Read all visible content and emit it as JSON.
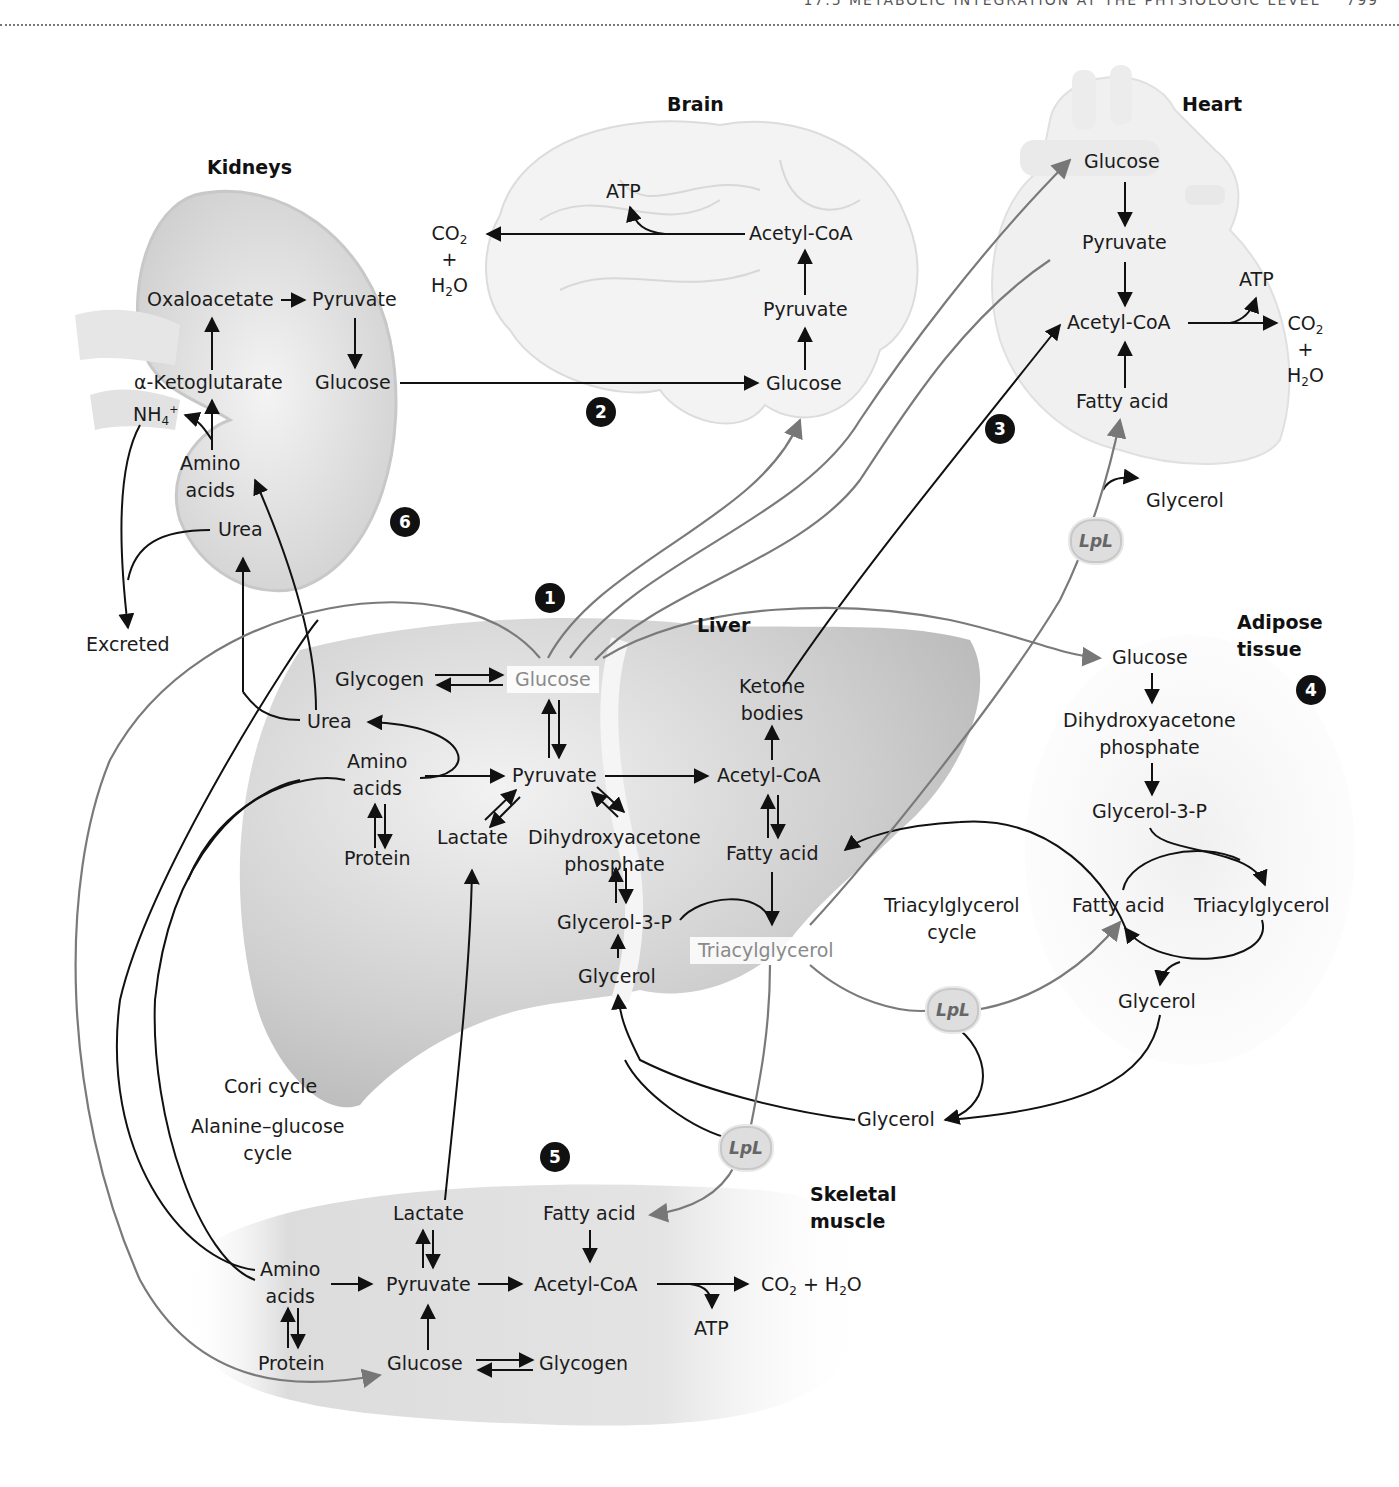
{
  "header": {
    "running_title": "17.5 METABOLIC INTEGRATION AT THE PHYSIOLOGIC LEVEL",
    "page": "799"
  },
  "organs": {
    "kidneys": "Kidneys",
    "brain": "Brain",
    "heart": "Heart",
    "liver": "Liver",
    "adipose": "Adipose tissue",
    "muscle": "Skeletal muscle"
  },
  "markers": [
    "1",
    "2",
    "3",
    "4",
    "5",
    "6"
  ],
  "enzyme": "LpL",
  "kidneys": {
    "oxaloacetate": "Oxaloacetate",
    "pyruvate": "Pyruvate",
    "alpha_ketoglutarate": "α-Ketoglutarate",
    "glucose": "Glucose",
    "nh4": "NH",
    "nh4_sub": "4",
    "nh4_sup": "+",
    "amino_acids_1": "Amino",
    "amino_acids_2": "acids",
    "urea": "Urea",
    "excreted": "Excreted"
  },
  "brain": {
    "atp": "ATP",
    "co2": "CO",
    "co2_sub": "2",
    "plus": "+",
    "h2o_h": "H",
    "h2o_sub": "2",
    "h2o_o": "O",
    "acetyl_coa": "Acetyl-CoA",
    "pyruvate": "Pyruvate",
    "glucose": "Glucose"
  },
  "heart": {
    "glucose": "Glucose",
    "pyruvate": "Pyruvate",
    "atp": "ATP",
    "acetyl_coa": "Acetyl-CoA",
    "co2": "CO",
    "co2_sub": "2",
    "plus": "+",
    "h2o_h": "H",
    "h2o_sub": "2",
    "h2o_o": "O",
    "fatty_acid": "Fatty acid",
    "glycerol": "Glycerol"
  },
  "liver": {
    "glycogen": "Glycogen",
    "glucose": "Glucose",
    "urea": "Urea",
    "amino_acids_1": "Amino",
    "amino_acids_2": "acids",
    "protein": "Protein",
    "pyruvate": "Pyruvate",
    "lactate": "Lactate",
    "dhap_1": "Dihydroxyacetone",
    "dhap_2": "phosphate",
    "glycerol_3_p": "Glycerol-3-P",
    "glycerol": "Glycerol",
    "ketone_1": "Ketone",
    "ketone_2": "bodies",
    "acetyl_coa": "Acetyl-CoA",
    "fatty_acid": "Fatty acid",
    "triacylglycerol": "Triacylglycerol"
  },
  "adipose": {
    "glucose": "Glucose",
    "dhap_1": "Dihydroxyacetone",
    "dhap_2": "phosphate",
    "glycerol_3_p": "Glycerol-3-P",
    "fatty_acid": "Fatty acid",
    "triacylglycerol": "Triacylglycerol",
    "glycerol": "Glycerol"
  },
  "cycles": {
    "tag_cycle_1": "Triacylglycerol",
    "tag_cycle_2": "cycle",
    "cori": "Cori cycle",
    "alanine_1": "Alanine–glucose",
    "alanine_2": "cycle"
  },
  "blood": {
    "glycerol": "Glycerol"
  },
  "muscle": {
    "lactate": "Lactate",
    "fatty_acid": "Fatty acid",
    "amino_acids_1": "Amino",
    "amino_acids_2": "acids",
    "pyruvate": "Pyruvate",
    "acetyl_coa": "Acetyl-CoA",
    "co2": "CO",
    "co2_sub": "2",
    "plus_h2o": " + H",
    "h2o_sub": "2",
    "h2o_o": "O",
    "atp": "ATP",
    "protein": "Protein",
    "glucose": "Glucose",
    "glycogen": "Glycogen"
  }
}
